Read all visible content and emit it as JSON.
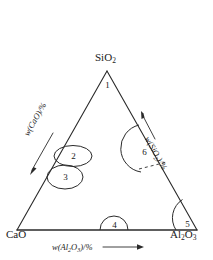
{
  "diagram": {
    "type": "ternary-phase-diagram",
    "title": "",
    "vertices": [
      {
        "id": "sio2",
        "label_html": "SiO<sub>2</sub>",
        "label_text": "SiO2",
        "x": 107,
        "y": 71,
        "position": "top"
      },
      {
        "id": "cao",
        "label_html": "CaO",
        "label_text": "CaO",
        "x": 17,
        "y": 230,
        "position": "bottom-left"
      },
      {
        "id": "al2o3",
        "label_html": "Al<sub>2</sub>O<sub>3</sub>",
        "label_text": "Al2O3",
        "x": 197,
        "y": 230,
        "position": "bottom-right"
      }
    ],
    "axes": [
      {
        "id": "axis-cao",
        "label_html": "w(CaO)/%",
        "label_text": "w(CaO)/%",
        "edge": "left",
        "arrow_direction": "down-left"
      },
      {
        "id": "axis-sio2",
        "label_html": "w(SiO<sub>2</sub>)/%",
        "label_text": "w(SiO2)/%",
        "edge": "right",
        "arrow_direction": "up-right"
      },
      {
        "id": "axis-al2o3",
        "label_html": "w(Al<sub>2</sub>O<sub>3</sub>)/%",
        "label_text": "w(Al2O3)/%",
        "edge": "bottom",
        "arrow_direction": "right"
      }
    ],
    "markers": [
      {
        "id": "marker-1",
        "label": "1",
        "shape": "vertex-apex",
        "x": 107,
        "y": 85
      },
      {
        "id": "marker-2",
        "label": "2",
        "shape": "ellipse",
        "x": 73,
        "y": 156
      },
      {
        "id": "marker-3",
        "label": "3",
        "shape": "ellipse",
        "x": 65,
        "y": 177
      },
      {
        "id": "marker-4",
        "label": "4",
        "shape": "arc-semicircle",
        "x": 114,
        "y": 224
      },
      {
        "id": "marker-5",
        "label": "5",
        "shape": "arc-corner",
        "x": 186,
        "y": 223
      },
      {
        "id": "marker-6",
        "label": "6",
        "shape": "arc-dashed",
        "x": 143,
        "y": 152
      }
    ],
    "colors": {
      "line": "#2a2a2a",
      "text": "#1a1a1a",
      "background": "#ffffff"
    }
  }
}
